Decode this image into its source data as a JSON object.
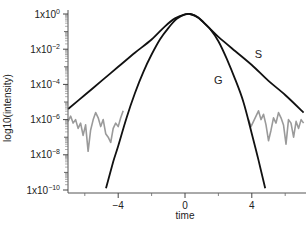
{
  "chart_data": {
    "type": "line",
    "title": "",
    "xlabel": "time",
    "ylabel": "log10(intensity)",
    "xlim": [
      -7.1,
      7.1
    ],
    "ylim_log10": [
      -10,
      0
    ],
    "x_ticks": [
      -4,
      0,
      4
    ],
    "x_tick_labels": [
      "-4",
      "0",
      "4"
    ],
    "x_minor_ticks": [
      -6,
      -2,
      2,
      6
    ],
    "y_ticks_log10": [
      0,
      -2,
      -4,
      -6,
      -8,
      -10
    ],
    "y_tick_labels": [
      "1x10^0",
      "1x10^-2",
      "1x10^-4",
      "1x10^-6",
      "1x10^-8",
      "1x10^-10"
    ],
    "grid": false,
    "legend": "none (inline curve labels)",
    "annotations": [
      {
        "text": "S",
        "x": 4.4,
        "y_log10": -2.5
      },
      {
        "text": "G",
        "x": 2.0,
        "y_log10": -4.0
      }
    ],
    "series": [
      {
        "name": "S",
        "color": "#111111",
        "x": [
          -7,
          -6,
          -5,
          -4,
          -3,
          -2,
          -1.2,
          -0.6,
          0,
          0.3,
          0.8,
          1.4,
          2,
          3,
          4,
          5,
          6,
          7.1
        ],
        "y_log10": [
          -5.4,
          -4.6,
          -3.8,
          -3.0,
          -2.2,
          -1.45,
          -0.7,
          -0.25,
          -0.02,
          0,
          -0.2,
          -0.75,
          -1.3,
          -2.1,
          -2.9,
          -3.8,
          -4.6,
          -5.6
        ]
      },
      {
        "name": "G",
        "color": "#111111",
        "x": [
          -4.73,
          -4.3,
          -4,
          -3.5,
          -3,
          -2.5,
          -2,
          -1.5,
          -1,
          -0.5,
          0,
          0.3,
          0.6,
          1,
          1.5,
          2,
          2.5,
          3,
          3.5,
          4,
          4.4,
          4.8
        ],
        "y_log10": [
          -9.9,
          -8.4,
          -7.5,
          -5.9,
          -4.5,
          -3.3,
          -2.3,
          -1.45,
          -0.8,
          -0.28,
          -0.02,
          0,
          -0.1,
          -0.38,
          -0.85,
          -1.55,
          -2.55,
          -3.7,
          -5.0,
          -6.8,
          -8.3,
          -9.9
        ]
      },
      {
        "name": "noise-left",
        "color": "#9a9a9a",
        "x": [
          -7,
          -6.85,
          -6.7,
          -6.55,
          -6.4,
          -6.25,
          -6.1,
          -5.95,
          -5.8,
          -5.65,
          -5.5,
          -5.35,
          -5.2,
          -5.05,
          -4.9,
          -4.75,
          -4.6,
          -4.45,
          -4.3,
          -4.15,
          -4.0,
          -3.85,
          -3.7
        ],
        "y_log10": [
          -6.1,
          -5.8,
          -6.2,
          -6.0,
          -6.5,
          -6.2,
          -6.9,
          -6.3,
          -7.8,
          -6.6,
          -6.0,
          -5.6,
          -5.9,
          -6.4,
          -6.0,
          -6.8,
          -7.0,
          -7.3,
          -6.5,
          -6.2,
          -6.4,
          -5.9,
          -5.5
        ]
      },
      {
        "name": "noise-right",
        "color": "#9a9a9a",
        "x": [
          3.8,
          3.95,
          4.1,
          4.25,
          4.4,
          4.55,
          4.7,
          4.85,
          5.0,
          5.15,
          5.3,
          5.45,
          5.6,
          5.75,
          5.9,
          6.05,
          6.2,
          6.35,
          6.5,
          6.65,
          6.8,
          6.95,
          7.1
        ],
        "y_log10": [
          -6.0,
          -6.4,
          -6.1,
          -5.8,
          -5.5,
          -6.0,
          -5.7,
          -6.3,
          -7.2,
          -6.6,
          -5.9,
          -6.2,
          -5.6,
          -5.9,
          -6.3,
          -7.4,
          -6.0,
          -6.2,
          -7.0,
          -6.1,
          -6.5,
          -6.0,
          -6.2
        ]
      }
    ]
  },
  "layout": {
    "plot_left_px": 68,
    "plot_right_px": 303,
    "y0_px": 14,
    "px_per_decade": 17.6,
    "x0_px": 185,
    "px_per_unit": 16.7,
    "xaxis_y_px": 193
  }
}
